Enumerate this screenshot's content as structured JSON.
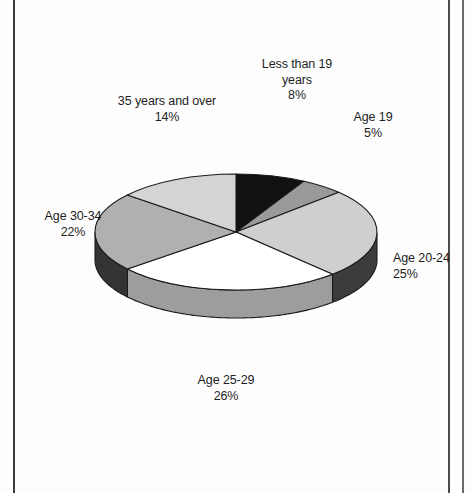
{
  "document": {
    "type": "scanned-page",
    "background_color": "#fdfdfd",
    "rule_color": "#3a3a3a"
  },
  "chart_data": {
    "type": "pie",
    "title": "",
    "subtitle": "",
    "xlabel": "",
    "ylabel": "",
    "legend_position": "none",
    "grid": false,
    "three_d": true,
    "start_angle_deg": 0,
    "direction": "clockwise",
    "units": "percent",
    "total": 100,
    "categories": [
      "Less than 19 years",
      "Age 19",
      "Age 20-24",
      "Age 25-29",
      "Age 30-34",
      "35 years and over"
    ],
    "values": [
      8,
      5,
      25,
      26,
      22,
      14
    ],
    "slices": [
      {
        "label": "Less than 19 years",
        "label_line1": "Less than 19",
        "label_line2": "years",
        "value": 8,
        "value_text": "8%",
        "color": "#111111",
        "side_color": "#0a0a0a"
      },
      {
        "label": "Age 19",
        "label_line1": "Age 19",
        "label_line2": "",
        "value": 5,
        "value_text": "5%",
        "color": "#9a9a9a",
        "side_color": "#6f6f6f"
      },
      {
        "label": "Age 20-24",
        "label_line1": "Age 20-24",
        "label_line2": "",
        "value": 25,
        "value_text": "25%",
        "color": "#cfcfcf",
        "side_color": "#3c3c3c"
      },
      {
        "label": "Age 25-29",
        "label_line1": "Age 25-29",
        "label_line2": "",
        "value": 26,
        "value_text": "26%",
        "color": "#ffffff",
        "side_color": "#9d9d9d"
      },
      {
        "label": "Age 30-34",
        "label_line1": "Age 30-34",
        "label_line2": "",
        "value": 22,
        "value_text": "22%",
        "color": "#b0b0b0",
        "side_color": "#343434"
      },
      {
        "label": "35 years and over",
        "label_line1": "35 years and over",
        "label_line2": "",
        "value": 14,
        "value_text": "14%",
        "color": "#d4d4d4",
        "side_color": "#3a3a3a"
      }
    ],
    "outline_color": "#1a1a1a"
  }
}
